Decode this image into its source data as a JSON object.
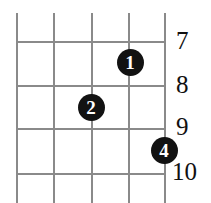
{
  "diagram": {
    "kind": "guitar-chord-diagram",
    "title": "",
    "colors": {
      "background": "#ffffff",
      "grid_line": "#8a8a8a",
      "dot_fill": "#121212",
      "dot_text": "#ffffff",
      "number_text": "#111111"
    },
    "grid": {
      "string_count": 5,
      "fret_line_count": 4,
      "strings": [
        {
          "name": "string-1",
          "x": 16
        },
        {
          "name": "string-2",
          "x": 53
        },
        {
          "name": "string-3",
          "x": 91
        },
        {
          "name": "string-4",
          "x": 128
        },
        {
          "name": "string-5",
          "x": 164
        }
      ],
      "string_top": 13,
      "string_bottom": 203,
      "frets": [
        {
          "name": "fret-line-7",
          "y": 41,
          "x_start": 16,
          "x_end": 164
        },
        {
          "name": "fret-line-8",
          "y": 85,
          "x_start": 16,
          "x_end": 164
        },
        {
          "name": "fret-line-9",
          "y": 128,
          "x_start": 16,
          "x_end": 164
        },
        {
          "name": "fret-line-10",
          "y": 173,
          "x_start": 16,
          "x_end": 164
        }
      ]
    },
    "fret_numbers": [
      {
        "label": "7",
        "x": 176,
        "y": 28
      },
      {
        "label": "8",
        "x": 176,
        "y": 72
      },
      {
        "label": "9",
        "x": 176,
        "y": 114
      },
      {
        "label": "10",
        "x": 172,
        "y": 159
      }
    ],
    "finger_dots": [
      {
        "label": "1",
        "x": 130,
        "y": 62,
        "string": 4,
        "fret": 7
      },
      {
        "label": "2",
        "x": 91,
        "y": 107,
        "string": 3,
        "fret": 8
      },
      {
        "label": "4",
        "x": 164,
        "y": 150,
        "string": 5,
        "fret": 9
      }
    ]
  }
}
